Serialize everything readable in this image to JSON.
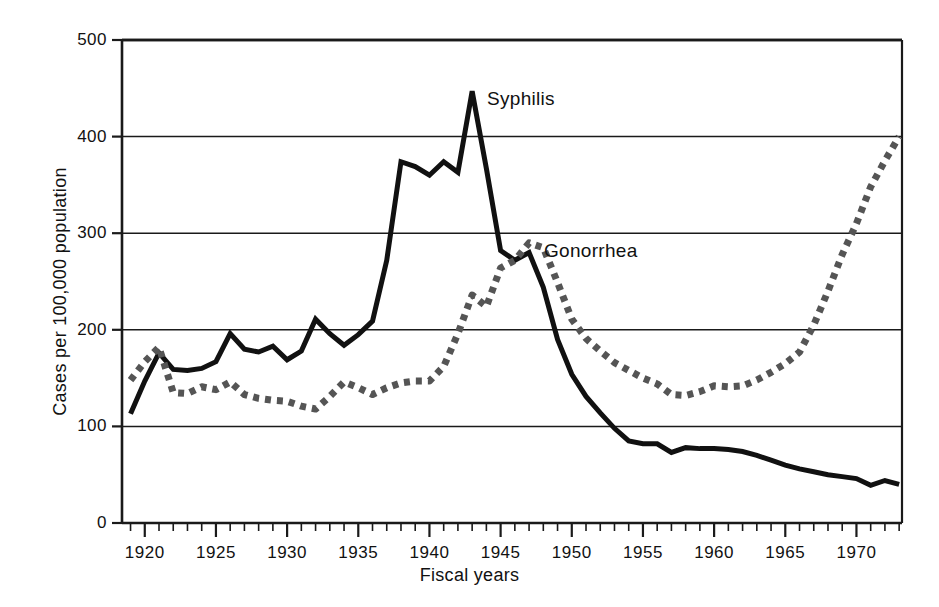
{
  "chart_data": {
    "type": "line",
    "title": "",
    "xlabel": "Fiscal years",
    "ylabel": "Cases per 100,000 population",
    "xlim": [
      1918.4,
      1973.2
    ],
    "ylim": [
      0,
      500
    ],
    "grid": true,
    "grid_axis": "y",
    "legend_position": "inline-annotations",
    "y_ticks": [
      "0",
      "100",
      "200",
      "300",
      "400",
      "500"
    ],
    "y_tick_values": [
      0,
      100,
      200,
      300,
      400,
      500
    ],
    "x_ticks": [
      "1920",
      "1925",
      "1930",
      "1935",
      "1940",
      "1945",
      "1950",
      "1955",
      "1960",
      "1965",
      "1970"
    ],
    "x_tick_values": [
      1920,
      1925,
      1930,
      1935,
      1940,
      1945,
      1950,
      1955,
      1960,
      1965,
      1970
    ],
    "x_minor_tick_interval": 1,
    "series": [
      {
        "name": "Syphilis",
        "style": "solid",
        "color": "#111111",
        "width": 5,
        "x": [
          1919,
          1920,
          1921,
          1922,
          1923,
          1924,
          1925,
          1926,
          1927,
          1928,
          1929,
          1930,
          1931,
          1932,
          1933,
          1934,
          1935,
          1936,
          1937,
          1938,
          1939,
          1940,
          1941,
          1942,
          1943,
          1944,
          1945,
          1946,
          1947,
          1948,
          1949,
          1950,
          1951,
          1952,
          1953,
          1954,
          1955,
          1956,
          1957,
          1958,
          1959,
          1960,
          1961,
          1962,
          1963,
          1964,
          1965,
          1966,
          1967,
          1968,
          1969,
          1970,
          1971,
          1972,
          1973
        ],
        "values": [
          113,
          147,
          176,
          159,
          158,
          160,
          167,
          196,
          180,
          177,
          183,
          169,
          178,
          211,
          196,
          184,
          195,
          209,
          272,
          374,
          369,
          360,
          374,
          363,
          447,
          367,
          282,
          272,
          280,
          244,
          190,
          154,
          131,
          114,
          98,
          85,
          82,
          82,
          73,
          78,
          77,
          77,
          76,
          74,
          70,
          65,
          60,
          56,
          53,
          50,
          48,
          46,
          39,
          44,
          40
        ]
      },
      {
        "name": "Gonorrhea",
        "style": "dotted",
        "color": "#555555",
        "width": 7,
        "x": [
          1919,
          1920,
          1921,
          1922,
          1923,
          1924,
          1925,
          1926,
          1927,
          1928,
          1929,
          1930,
          1931,
          1932,
          1933,
          1934,
          1935,
          1936,
          1937,
          1938,
          1939,
          1940,
          1941,
          1942,
          1943,
          1944,
          1945,
          1946,
          1947,
          1948,
          1949,
          1950,
          1951,
          1952,
          1953,
          1954,
          1955,
          1956,
          1957,
          1958,
          1959,
          1960,
          1961,
          1962,
          1963,
          1964,
          1965,
          1966,
          1967,
          1968,
          1969,
          1970,
          1971,
          1972,
          1973
        ],
        "values": [
          148,
          167,
          182,
          135,
          134,
          141,
          138,
          146,
          133,
          129,
          127,
          126,
          121,
          118,
          131,
          146,
          140,
          133,
          140,
          145,
          147,
          147,
          162,
          196,
          236,
          224,
          264,
          272,
          290,
          285,
          249,
          211,
          191,
          178,
          166,
          158,
          150,
          144,
          133,
          132,
          136,
          142,
          141,
          142,
          148,
          156,
          165,
          177,
          205,
          240,
          278,
          310,
          348,
          375,
          400
        ]
      }
    ],
    "annotations": [
      {
        "text": "Syphilis",
        "series": "Syphilis"
      },
      {
        "text": "Gonorrhea",
        "series": "Gonorrhea"
      }
    ]
  }
}
